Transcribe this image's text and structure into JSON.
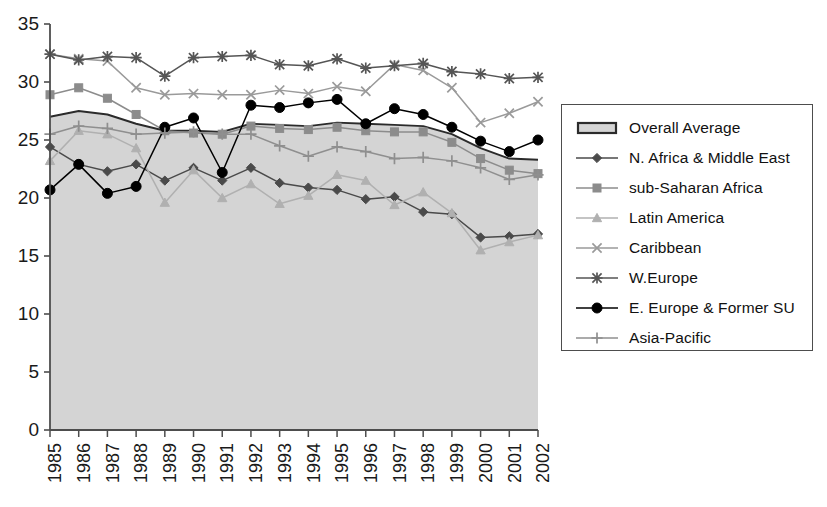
{
  "chart_data": {
    "type": "line",
    "title": "",
    "subtitle": "",
    "xlabel": "",
    "ylabel": "",
    "x": [
      1985,
      1986,
      1987,
      1988,
      1989,
      1990,
      1991,
      1992,
      1993,
      1994,
      1995,
      1996,
      1997,
      1998,
      1999,
      2000,
      2001,
      2002
    ],
    "categories": [
      "1985",
      "1986",
      "1987",
      "1988",
      "1989",
      "1990",
      "1991",
      "1992",
      "1993",
      "1994",
      "1995",
      "1996",
      "1997",
      "1998",
      "1999",
      "2000",
      "2001",
      "2002"
    ],
    "ylim": [
      0,
      35
    ],
    "yticks": [
      0,
      5,
      10,
      15,
      20,
      25,
      30,
      35
    ],
    "xlim": [
      1985,
      2002
    ],
    "grid": false,
    "legend_position": "right",
    "series": [
      {
        "name": "Overall Average",
        "marker": "area-band",
        "style": "filled-area",
        "color": "#d4d4d4",
        "edge_color": "#2b2b2b",
        "values": [
          27.0,
          27.5,
          27.2,
          26.4,
          25.8,
          25.8,
          25.7,
          26.4,
          26.3,
          26.2,
          26.5,
          26.4,
          26.3,
          26.2,
          25.5,
          24.3,
          23.4,
          23.3
        ]
      },
      {
        "name": "N. Africa & Middle East",
        "marker": "diamond",
        "color": "#4a4a4a",
        "values": [
          24.4,
          22.9,
          22.3,
          22.9,
          21.5,
          22.6,
          21.5,
          22.6,
          21.3,
          20.9,
          20.7,
          19.9,
          20.1,
          18.8,
          18.6,
          16.6,
          16.7,
          16.9
        ]
      },
      {
        "name": "sub-Saharan Africa",
        "marker": "square",
        "color": "#8c8c8c",
        "values": [
          28.9,
          29.5,
          28.6,
          27.2,
          25.8,
          25.6,
          25.5,
          26.2,
          26.0,
          25.9,
          26.1,
          25.8,
          25.7,
          25.7,
          24.8,
          23.4,
          22.4,
          22.1
        ]
      },
      {
        "name": "Latin America",
        "marker": "triangle",
        "color": "#b0b0b0",
        "values": [
          23.2,
          25.8,
          25.5,
          24.3,
          19.6,
          22.4,
          20.0,
          21.2,
          19.5,
          20.2,
          22.0,
          21.5,
          19.4,
          20.5,
          18.7,
          15.5,
          16.2,
          16.8
        ]
      },
      {
        "name": "Caribbean",
        "marker": "x",
        "color": "#9a9a9a",
        "values": [
          32.4,
          32.0,
          31.8,
          29.5,
          28.9,
          29.0,
          28.9,
          28.9,
          29.3,
          29.0,
          29.6,
          29.2,
          31.5,
          31.0,
          29.5,
          26.5,
          27.3,
          28.3
        ]
      },
      {
        "name": "W.Europe",
        "marker": "asterisk",
        "color": "#555555",
        "values": [
          32.4,
          31.9,
          32.2,
          32.1,
          30.5,
          32.1,
          32.2,
          32.3,
          31.5,
          31.4,
          32.0,
          31.2,
          31.4,
          31.6,
          30.9,
          30.7,
          30.3,
          30.4
        ]
      },
      {
        "name": "E. Europe & Former SU",
        "marker": "circle",
        "color": "#000000",
        "values": [
          20.7,
          22.9,
          20.4,
          21.0,
          26.1,
          26.9,
          22.2,
          28.0,
          27.8,
          28.2,
          28.5,
          26.4,
          27.7,
          27.2,
          26.1,
          24.9,
          24.0,
          25.0
        ]
      },
      {
        "name": "Asia-Pacific",
        "marker": "plus",
        "color": "#8f8f8f",
        "values": [
          25.5,
          26.2,
          26.0,
          25.5,
          25.6,
          25.7,
          25.5,
          25.5,
          24.5,
          23.6,
          24.4,
          24.0,
          23.4,
          23.5,
          23.2,
          22.6,
          21.6,
          22.0
        ]
      }
    ]
  },
  "legend": {
    "items": [
      {
        "label": "Overall Average",
        "symbol": "area-swatch-icon"
      },
      {
        "label": "N. Africa & Middle East",
        "symbol": "diamond-marker-icon"
      },
      {
        "label": "sub-Saharan Africa",
        "symbol": "square-marker-icon"
      },
      {
        "label": "Latin America",
        "symbol": "triangle-marker-icon"
      },
      {
        "label": "Caribbean",
        "symbol": "x-marker-icon"
      },
      {
        "label": "W.Europe",
        "symbol": "asterisk-marker-icon"
      },
      {
        "label": "E. Europe & Former SU",
        "symbol": "circle-marker-icon"
      },
      {
        "label": "Asia-Pacific",
        "symbol": "plus-marker-icon"
      }
    ]
  },
  "axes": {
    "y_ticks": [
      "0",
      "5",
      "10",
      "15",
      "20",
      "25",
      "30",
      "35"
    ],
    "x_ticks": [
      "1985",
      "1986",
      "1987",
      "1988",
      "1989",
      "1990",
      "1991",
      "1992",
      "1993",
      "1994",
      "1995",
      "1996",
      "1997",
      "1998",
      "1999",
      "2000",
      "2001",
      "2002"
    ]
  },
  "colors": {
    "area_fill": "#d4d4d4",
    "area_edge": "#2b2b2b",
    "axis": "#4d4d4d",
    "text": "#1a1a1a"
  }
}
